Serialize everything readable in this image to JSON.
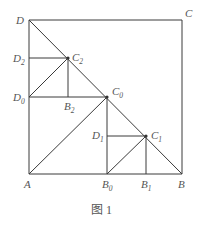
{
  "figure": {
    "caption": "图 1",
    "points": {
      "A": {
        "name": "A",
        "sub": "",
        "x": 29,
        "y": 174
      },
      "B": {
        "name": "B",
        "sub": "",
        "x": 182,
        "y": 174
      },
      "C": {
        "name": "C",
        "sub": "",
        "x": 182,
        "y": 20
      },
      "D": {
        "name": "D",
        "sub": "",
        "x": 29,
        "y": 20
      },
      "C0": {
        "name": "C",
        "sub": "0",
        "x": 107,
        "y": 97
      },
      "B0": {
        "name": "B",
        "sub": "0",
        "x": 107,
        "y": 174
      },
      "D0": {
        "name": "D",
        "sub": "0",
        "x": 29,
        "y": 97
      },
      "C1": {
        "name": "C",
        "sub": "1",
        "x": 146,
        "y": 136
      },
      "B1": {
        "name": "B",
        "sub": "1",
        "x": 146,
        "y": 174
      },
      "D1": {
        "name": "D",
        "sub": "1",
        "x": 107,
        "y": 136
      },
      "C2": {
        "name": "C",
        "sub": "2",
        "x": 68,
        "y": 58
      },
      "B2": {
        "name": "B",
        "sub": "2",
        "x": 68,
        "y": 97
      },
      "D2": {
        "name": "D",
        "sub": "2",
        "x": 29,
        "y": 58
      }
    },
    "segments": [
      [
        "A",
        "B"
      ],
      [
        "B",
        "C"
      ],
      [
        "C",
        "D"
      ],
      [
        "D",
        "A"
      ],
      [
        "D",
        "B"
      ],
      [
        "A",
        "C0"
      ],
      [
        "C0",
        "B0"
      ],
      [
        "C0",
        "D0"
      ],
      [
        "B0",
        "C1"
      ],
      [
        "C1",
        "B1"
      ],
      [
        "C1",
        "D1"
      ],
      [
        "D1",
        "B0"
      ],
      [
        "D0",
        "C2"
      ],
      [
        "C2",
        "B2"
      ],
      [
        "C2",
        "D2"
      ]
    ]
  }
}
